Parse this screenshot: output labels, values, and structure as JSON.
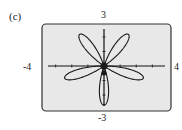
{
  "panel_label": "(c)",
  "window": {
    "xmin": "-4",
    "xmax": "4",
    "ymin": "-3",
    "ymax": "3"
  },
  "colors": {
    "screen_bg": "#e8e8e8",
    "curve": "#1a1a1a",
    "border": "#333333"
  },
  "chart_data": {
    "type": "line",
    "title": "",
    "equation_form": "r = -3 sin(5θ) (five-petaled rose, one petal pointing straight down)",
    "petals": 5,
    "petal_directions_deg": [
      54,
      126,
      198,
      270,
      342
    ],
    "petal_length": 2.7,
    "xlim": [
      -4,
      4
    ],
    "ylim": [
      -3,
      3
    ],
    "tick_labels": {
      "x": [
        "-4",
        "4"
      ],
      "y": [
        "-3",
        "3"
      ]
    },
    "grid": false,
    "legend": null
  }
}
